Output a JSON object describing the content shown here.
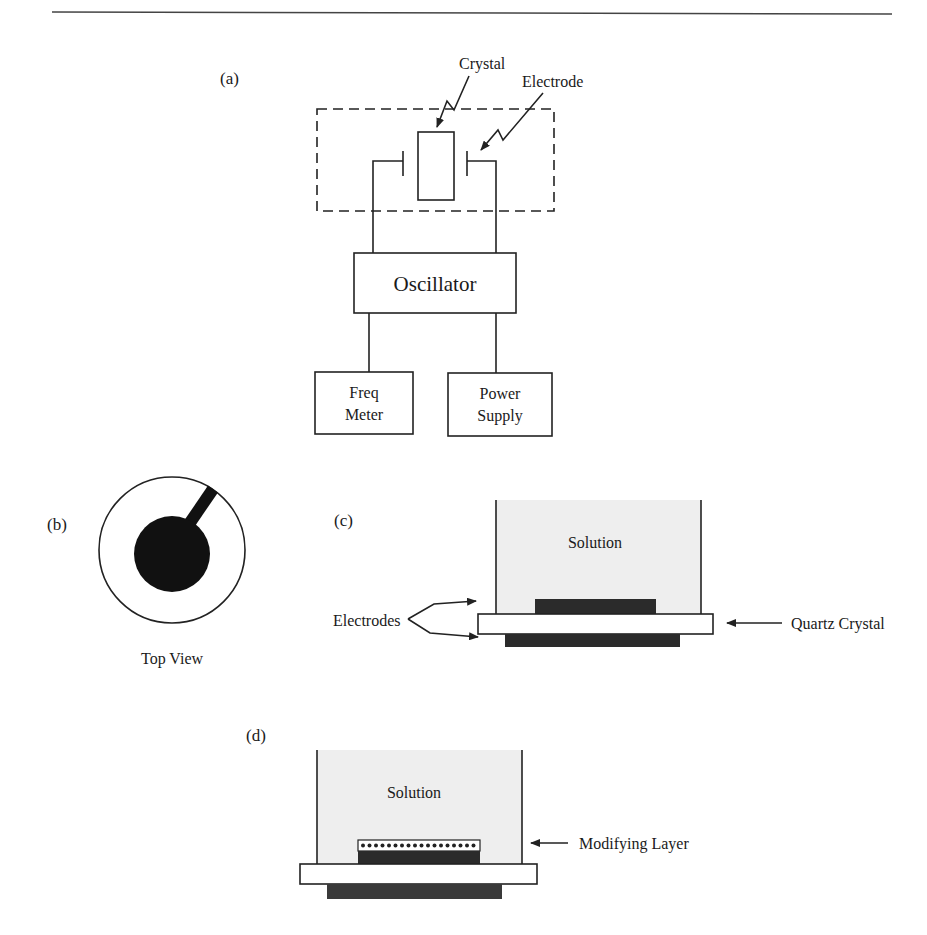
{
  "figure": {
    "panels": {
      "a": {
        "label": "(a)",
        "crystal_label": "Crystal",
        "electrode_label": "Electrode",
        "oscillator_label": "Oscillator",
        "freq_meter_label": [
          "Freq",
          "Meter"
        ],
        "power_supply_label": [
          "Power",
          "Supply"
        ]
      },
      "b": {
        "label": "(b)",
        "caption": "Top View"
      },
      "c": {
        "label": "(c)",
        "solution_label": "Solution",
        "electrodes_label": "Electrodes",
        "quartz_label": "Quartz Crystal"
      },
      "d": {
        "label": "(d)",
        "solution_label": "Solution",
        "modifying_layer_label": "Modifying Layer"
      }
    },
    "colors": {
      "line": "#222222",
      "electrode": "#2b2b2b",
      "solution": "#eeeeee",
      "background": "#ffffff"
    }
  }
}
